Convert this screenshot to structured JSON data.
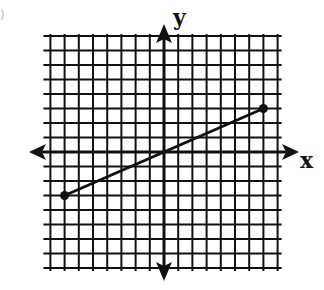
{
  "chart_data": {
    "type": "line",
    "title": "",
    "xlabel": "x",
    "ylabel": "y",
    "xlim": [
      -8,
      8
    ],
    "ylim": [
      -8,
      8
    ],
    "grid": true,
    "grid_step": 1,
    "tick_labels": false,
    "series": [
      {
        "name": "segment",
        "points": [
          [
            -7,
            -3
          ],
          [
            7,
            3
          ]
        ],
        "endpoints": "closed-dots"
      }
    ]
  },
  "labels": {
    "x_axis": "x",
    "y_axis": "y",
    "fragment": ")"
  },
  "colors": {
    "ink": "#111111",
    "background": "#ffffff"
  }
}
